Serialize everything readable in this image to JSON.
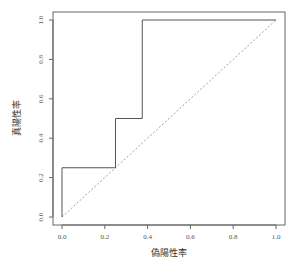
{
  "chart_data": {
    "type": "line",
    "title": "",
    "xlabel": "偽陽性率",
    "ylabel": "真陽性率",
    "xlim": [
      0,
      1
    ],
    "ylim": [
      0,
      1
    ],
    "grid": false,
    "legend": null,
    "x_ticks": [
      "0.0",
      "0.2",
      "0.4",
      "0.6",
      "0.8",
      "1.0"
    ],
    "y_ticks": [
      "0.0",
      "0.2",
      "0.4",
      "0.6",
      "0.8",
      "1.0"
    ],
    "series": [
      {
        "name": "ROC curve",
        "style": "solid step",
        "x": [
          0.0,
          0.0,
          0.25,
          0.25,
          0.375,
          0.375,
          1.0
        ],
        "y": [
          0.0,
          0.25,
          0.25,
          0.5,
          0.5,
          1.0,
          1.0
        ]
      },
      {
        "name": "random classifier diagonal",
        "style": "dashed",
        "x": [
          0.0,
          1.0
        ],
        "y": [
          0.0,
          1.0
        ]
      }
    ]
  },
  "colors": {
    "line": "#555555",
    "diagonal": "#888888",
    "axis": "#666666",
    "background": "#ffffff"
  }
}
